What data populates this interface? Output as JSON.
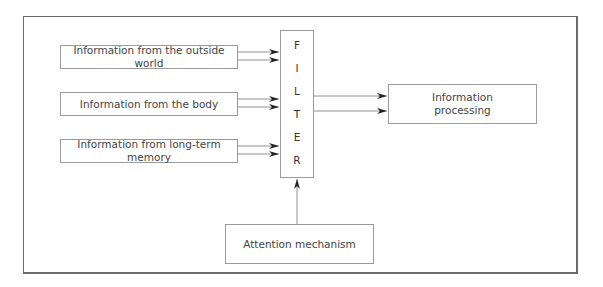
{
  "diagram": {
    "inputs": [
      {
        "label": "Information from the outside world"
      },
      {
        "label": "Information from the body"
      },
      {
        "label": "Information from long-term memory"
      }
    ],
    "filter": {
      "letters": [
        "F",
        "I",
        "L",
        "T",
        "E",
        "R"
      ]
    },
    "output": {
      "line1": "Information",
      "line2": "processing"
    },
    "control": {
      "label": "Attention mechanism"
    }
  }
}
